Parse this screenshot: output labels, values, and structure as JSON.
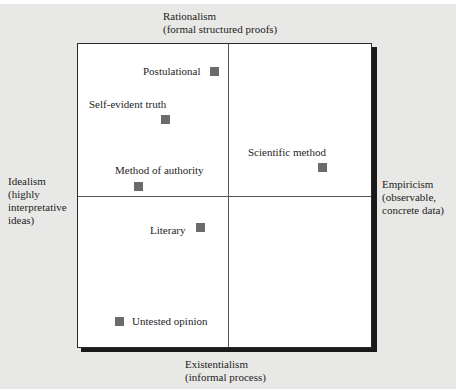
{
  "diagram": {
    "type": "quadrant",
    "axes": {
      "top": {
        "title": "Rationalism",
        "subtitle": "(formal structured proofs)"
      },
      "bottom": {
        "title": "Existentialism",
        "subtitle": "(informal process)"
      },
      "left": {
        "title": "Idealism",
        "subtitle_lines": [
          "(highly",
          "interpretative",
          "ideas)"
        ]
      },
      "right": {
        "title": "Empiricism",
        "subtitle_lines": [
          "(observable,",
          "concrete data)"
        ]
      }
    },
    "points": [
      {
        "label": "Postulational",
        "quadrant": "top-left"
      },
      {
        "label": "Self-evident truth",
        "quadrant": "top-left"
      },
      {
        "label": "Method of authority",
        "quadrant": "top-left"
      },
      {
        "label": "Scientific method",
        "quadrant": "top-right"
      },
      {
        "label": "Literary",
        "quadrant": "bottom-left"
      },
      {
        "label": "Untested opinion",
        "quadrant": "bottom-left"
      }
    ],
    "colors": {
      "marker": "#6b6b6b",
      "background": "#e8e8e6",
      "border": "#2a2a2a"
    }
  }
}
